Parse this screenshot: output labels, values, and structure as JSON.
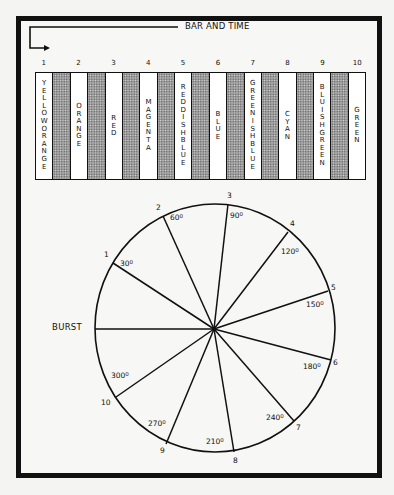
{
  "diagram": {
    "title": "BAR AND TIME",
    "bar_numbers": [
      "1",
      "2",
      "3",
      "4",
      "5",
      "6",
      "7",
      "8",
      "9",
      "10"
    ],
    "bars": [
      {
        "type": "white",
        "label": "YELLOW ORANGE"
      },
      {
        "type": "gray",
        "label": ""
      },
      {
        "type": "white",
        "label": "ORANGE"
      },
      {
        "type": "gray",
        "label": ""
      },
      {
        "type": "white",
        "label": "RED"
      },
      {
        "type": "gray",
        "label": ""
      },
      {
        "type": "white",
        "label": "MAGENTA"
      },
      {
        "type": "gray",
        "label": ""
      },
      {
        "type": "white",
        "label": "REDDISHBLUE"
      },
      {
        "type": "gray",
        "label": ""
      },
      {
        "type": "white",
        "label": "BLUE"
      },
      {
        "type": "gray",
        "label": ""
      },
      {
        "type": "white",
        "label": "GREENISHBLUE"
      },
      {
        "type": "gray",
        "label": ""
      },
      {
        "type": "white",
        "label": "CYAN"
      },
      {
        "type": "gray",
        "label": ""
      },
      {
        "type": "white",
        "label": "BLUISHGREEN"
      },
      {
        "type": "gray",
        "label": ""
      },
      {
        "type": "white",
        "label": "GREEN"
      }
    ],
    "burst_label": "BURST",
    "wheel": {
      "center": [
        214,
        329
      ],
      "spokes": [
        {
          "name": "burst",
          "end": [
            95,
            329
          ]
        },
        {
          "name": "1",
          "end": [
            113,
            263
          ]
        },
        {
          "name": "2",
          "end": [
            163,
            216
          ]
        },
        {
          "name": "3",
          "end": [
            228,
            204
          ]
        },
        {
          "name": "4",
          "end": [
            288,
            232
          ]
        },
        {
          "name": "5",
          "end": [
            328,
            291
          ]
        },
        {
          "name": "6",
          "end": [
            331,
            360
          ]
        },
        {
          "name": "7",
          "end": [
            294,
            421
          ]
        },
        {
          "name": "8",
          "end": [
            234,
            452
          ]
        },
        {
          "name": "9",
          "end": [
            166,
            444
          ]
        },
        {
          "name": "10",
          "end": [
            116,
            397
          ]
        }
      ],
      "spoke_numbers": [
        {
          "text": "1",
          "x": 104,
          "y": 250
        },
        {
          "text": "2",
          "x": 156,
          "y": 203
        },
        {
          "text": "3",
          "x": 227,
          "y": 191
        },
        {
          "text": "4",
          "x": 290,
          "y": 219
        },
        {
          "text": "5",
          "x": 331,
          "y": 283
        },
        {
          "text": "6",
          "x": 333,
          "y": 358
        },
        {
          "text": "7",
          "x": 296,
          "y": 423
        },
        {
          "text": "8",
          "x": 233,
          "y": 456
        },
        {
          "text": "9",
          "x": 160,
          "y": 446
        },
        {
          "text": "10",
          "x": 101,
          "y": 398
        }
      ],
      "degree_labels": [
        {
          "value": "30",
          "x": 120,
          "y": 259
        },
        {
          "value": "60",
          "x": 170,
          "y": 213
        },
        {
          "value": "90",
          "x": 230,
          "y": 211
        },
        {
          "value": "120",
          "x": 281,
          "y": 247
        },
        {
          "value": "150",
          "x": 306,
          "y": 300
        },
        {
          "value": "180",
          "x": 303,
          "y": 362
        },
        {
          "value": "240",
          "x": 266,
          "y": 413
        },
        {
          "value": "210",
          "x": 206,
          "y": 437
        },
        {
          "value": "270",
          "x": 148,
          "y": 419
        },
        {
          "value": "300",
          "x": 111,
          "y": 371
        }
      ],
      "degree_suffix": "0"
    }
  }
}
